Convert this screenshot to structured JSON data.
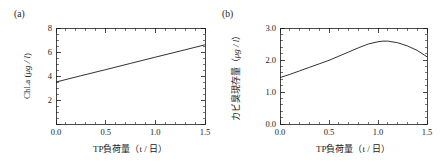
{
  "figure": {
    "background_color": "#ffffff",
    "line_color": "#1a1a1a",
    "panel_count": 2
  },
  "panels": {
    "a": {
      "tag": "(a)",
      "xlabel": "TP負荷量（t / 日）",
      "ylabel_main": "Chl.a (",
      "ylabel_unit": "μg / l",
      "ylabel_close": ")",
      "ylabel_full": "Chl.a (μg / l)",
      "xticks": [
        "0.0",
        "0.5",
        "1.0",
        "1.5"
      ],
      "yticks": [
        "",
        "2",
        "4",
        "6",
        "8"
      ]
    },
    "b": {
      "tag": "(b)",
      "xlabel": "TP負荷量（t / 日）",
      "ylabel_main": "カビ臭現存量（",
      "ylabel_unit": "μg / l",
      "ylabel_close": "）",
      "ylabel_full": "カビ臭現存量（μg / l）",
      "xticks": [
        "0.0",
        "0.5",
        "1.0",
        "1.5"
      ],
      "yticks": [
        "0.0",
        "1.0",
        "2.0",
        "3.0"
      ]
    }
  },
  "chart_data": [
    {
      "type": "line",
      "panel": "a",
      "title": "(a)",
      "xlabel": "TP負荷量（t / 日）",
      "ylabel": "Chl.a (μg / l)",
      "xlim": [
        0.0,
        1.5
      ],
      "ylim": [
        0,
        8
      ],
      "xticks": [
        0.0,
        0.5,
        1.0,
        1.5
      ],
      "yticks": [
        0,
        2,
        4,
        6,
        8
      ],
      "xtick_labels": [
        "0.0",
        "0.5",
        "1.0",
        "1.5"
      ],
      "ytick_labels": [
        "",
        "2",
        "4",
        "6",
        "8"
      ],
      "minor_ticks": true,
      "grid": false,
      "legend": false,
      "series": [
        {
          "name": "Chl.a",
          "x": [
            0.0,
            0.25,
            0.5,
            0.75,
            1.0,
            1.25,
            1.5
          ],
          "y": [
            3.5,
            4.02,
            4.53,
            5.05,
            5.57,
            6.08,
            6.6
          ]
        }
      ]
    },
    {
      "type": "line",
      "panel": "b",
      "title": "(b)",
      "xlabel": "TP負荷量（t / 日）",
      "ylabel": "カビ臭現存量（μg / l）",
      "xlim": [
        0.0,
        1.5
      ],
      "ylim": [
        0.0,
        3.0
      ],
      "xticks": [
        0.0,
        0.5,
        1.0,
        1.5
      ],
      "yticks": [
        0.0,
        1.0,
        2.0,
        3.0
      ],
      "xtick_labels": [
        "0.0",
        "0.5",
        "1.0",
        "1.5"
      ],
      "ytick_labels": [
        "0.0",
        "1.0",
        "2.0",
        "3.0"
      ],
      "minor_ticks": true,
      "grid": false,
      "legend": false,
      "series": [
        {
          "name": "カビ臭現存量",
          "x": [
            0.0,
            0.1,
            0.2,
            0.3,
            0.4,
            0.5,
            0.6,
            0.7,
            0.8,
            0.9,
            1.0,
            1.05,
            1.1,
            1.2,
            1.3,
            1.4,
            1.5
          ],
          "y": [
            1.45,
            1.55,
            1.66,
            1.77,
            1.88,
            1.99,
            2.12,
            2.25,
            2.38,
            2.5,
            2.57,
            2.59,
            2.59,
            2.54,
            2.44,
            2.3,
            2.1
          ]
        }
      ]
    }
  ]
}
